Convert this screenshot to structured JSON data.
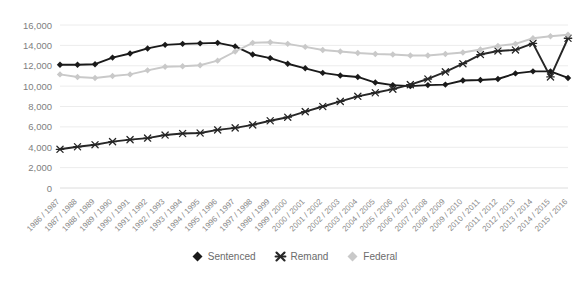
{
  "chart_data": {
    "type": "line",
    "title": "",
    "xlabel": "",
    "ylabel": "",
    "ylim": [
      0,
      16000
    ],
    "ytick_step": 2000,
    "grid": true,
    "legend_position": "bottom",
    "ytick_labels": [
      "16,000",
      "14,000",
      "12,000",
      "10,000",
      "8,000",
      "6,000",
      "4,000",
      "2,000",
      "0"
    ],
    "ytick_values": [
      16000,
      14000,
      12000,
      10000,
      8000,
      6000,
      4000,
      2000,
      0
    ],
    "categories": [
      "1986 / 1987",
      "1987 / 1988",
      "1988 / 1989",
      "1989 / 1990",
      "1990 / 1991",
      "1991 / 1992",
      "1992 / 1993",
      "1993 / 1994",
      "1994 / 1995",
      "1995 / 1996",
      "1996 / 1997",
      "1997 / 1998",
      "1998 / 1999",
      "1999 / 2000",
      "2000 / 2001",
      "2001 / 2002",
      "2002 / 2003",
      "2003 / 2004",
      "2004 / 2005",
      "2005 / 2006",
      "2006 / 2007",
      "2007 / 2008",
      "2008 / 2009",
      "2009 / 2010",
      "2010 / 2011",
      "2011 / 2012",
      "2012 / 2013",
      "2013 / 2014",
      "2014 / 2015",
      "2015 / 2016"
    ],
    "series": [
      {
        "name": "Sentenced",
        "color": "#1a1a1a",
        "marker": "diamond",
        "values": [
          12100,
          12100,
          12150,
          12800,
          13200,
          13700,
          14050,
          14150,
          14200,
          14250,
          13900,
          13100,
          12750,
          12200,
          11750,
          11300,
          11050,
          10900,
          10350,
          10100,
          10000,
          10100,
          10150,
          10550,
          10600,
          10700,
          11250,
          11450,
          11450,
          10800
        ]
      },
      {
        "name": "Remand",
        "color": "#262626",
        "marker": "x",
        "values": [
          3800,
          4050,
          4250,
          4550,
          4750,
          4900,
          5200,
          5350,
          5400,
          5700,
          5900,
          6200,
          6600,
          6950,
          7500,
          8000,
          8500,
          9000,
          9350,
          9700,
          10150,
          10700,
          11400,
          12200,
          13100,
          13450,
          13550,
          14200,
          10900,
          14700
        ]
      },
      {
        "name": "Federal",
        "color": "#c9c9c9",
        "marker": "diamond",
        "values": [
          11150,
          10900,
          10800,
          11000,
          11150,
          11550,
          11900,
          11950,
          12050,
          12500,
          13400,
          14250,
          14300,
          14150,
          13850,
          13550,
          13400,
          13250,
          13150,
          13100,
          13000,
          13000,
          13150,
          13300,
          13600,
          13950,
          14150,
          14700,
          14900,
          15050
        ]
      }
    ]
  },
  "legend": {
    "items": [
      {
        "label": "Sentenced"
      },
      {
        "label": "Remand"
      },
      {
        "label": "Federal"
      }
    ]
  }
}
